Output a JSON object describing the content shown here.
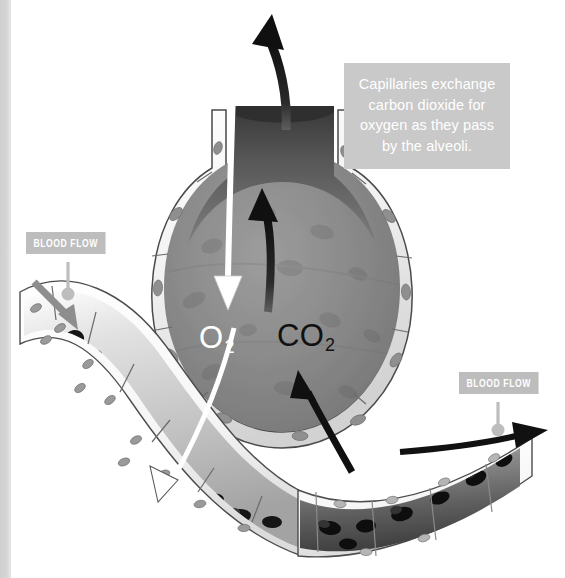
{
  "figure": {
    "type": "anatomical-illustration",
    "background_color": "#ffffff",
    "width": 565,
    "height": 578
  },
  "caption": {
    "text": "Capillaries exchange carbon dioxide for oxygen as they pass by the alveoli.",
    "box_color": "#c9c9c9",
    "text_color": "#ffffff"
  },
  "callouts": [
    {
      "label": "BLOOD FLOW",
      "position": "left",
      "box_color": "#bdbdbd",
      "text_color": "#ffffff"
    },
    {
      "label": "BLOOD FLOW",
      "position": "right",
      "box_color": "#bdbdbd",
      "text_color": "#ffffff"
    }
  ],
  "gas_labels": [
    {
      "formula": "O",
      "subscript": "2",
      "name": "oxygen",
      "color": "#ffffff"
    },
    {
      "formula": "CO",
      "subscript": "2",
      "name": "carbon dioxide",
      "color": "#111111"
    }
  ],
  "structures": {
    "alveolus": {
      "name": "alveolus",
      "interior_color": "#8a8a8a",
      "wall_color": "#f4f4f4",
      "outline_color": "#4a4a4a"
    },
    "capillary": {
      "name": "capillary",
      "inflow_tint": "#d8d8d8",
      "outflow_tint": "#6a6a6a",
      "wall_color": "#fbfbfb",
      "red_blood_cell_color": "#141414"
    }
  },
  "arrows": [
    {
      "name": "co2-exhaled",
      "color": "#111111",
      "direction": "up-out-of-alveolus"
    },
    {
      "name": "co2-into-alveolus-upper",
      "color": "#111111",
      "direction": "up"
    },
    {
      "name": "co2-from-capillary",
      "color": "#111111",
      "direction": "up-left"
    },
    {
      "name": "o2-inhaled",
      "color": "#ffffff",
      "direction": "down-into-alveolus"
    },
    {
      "name": "o2-into-capillary",
      "color": "#ffffff",
      "direction": "down-left"
    },
    {
      "name": "blood-flow-in",
      "color": "#8e8e8e",
      "direction": "down-right"
    },
    {
      "name": "blood-flow-out",
      "color": "#111111",
      "direction": "right"
    }
  ]
}
